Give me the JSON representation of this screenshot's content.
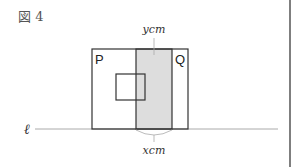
{
  "figure": {
    "label": "図 4",
    "rect_p_label": "P",
    "rect_q_label": "Q",
    "top_measure_label": "ycm",
    "bottom_measure_label": "xcm",
    "line_label": "ℓ"
  },
  "colors": {
    "stroke": "#333333",
    "shade": "#dddddd",
    "line": "#aaaaaa"
  }
}
